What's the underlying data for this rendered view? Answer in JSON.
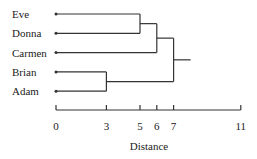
{
  "chart_data": {
    "type": "dendrogram",
    "title": "",
    "xlabel": "Distance",
    "ylabel": "",
    "xlim": [
      0,
      11
    ],
    "x_ticks": [
      0,
      3,
      5,
      6,
      7,
      11
    ],
    "x_tick_labels": [
      "0",
      "3",
      "5",
      "6",
      "7",
      "11"
    ],
    "leaves": [
      "Eve",
      "Donna",
      "Carmen",
      "Brian",
      "Adam"
    ],
    "merges": [
      {
        "left": "Brian",
        "right": "Adam",
        "distance": 3
      },
      {
        "left": "Eve",
        "right": "Donna",
        "distance": 5
      },
      {
        "left": "Eve+Donna",
        "right": "Carmen",
        "distance": 6
      },
      {
        "left": "Eve+Donna+Carmen",
        "right": "Brian+Adam",
        "distance": 7
      }
    ],
    "grid": false,
    "legend": null
  },
  "colors": {
    "line": "#333333",
    "text": "#222222",
    "background": "#ffffff"
  }
}
